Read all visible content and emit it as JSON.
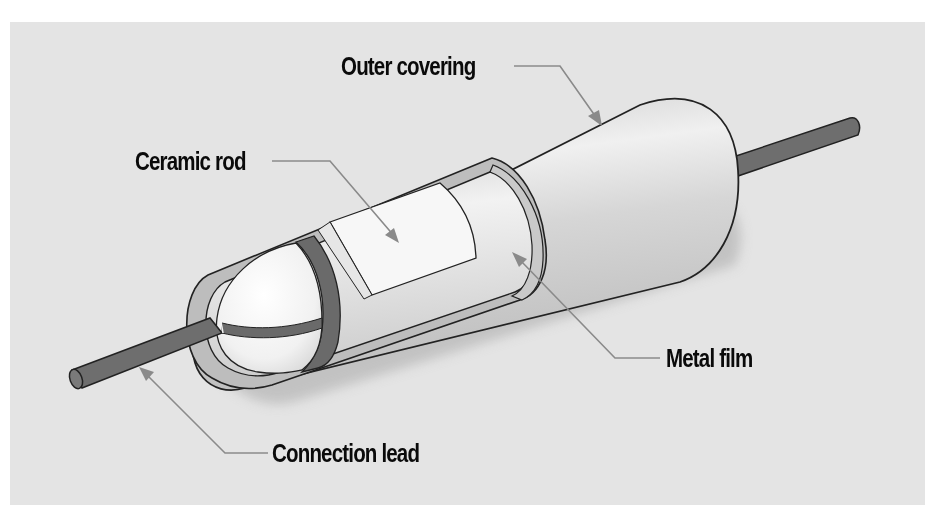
{
  "diagram": {
    "labels": {
      "outer_covering": "Outer covering",
      "ceramic_rod": "Ceramic rod",
      "metal_film": "Metal film",
      "connection_lead": "Connection lead"
    },
    "colors": {
      "background_panel": "#e4e4e4",
      "page": "#ffffff",
      "casing": "#cfcfcf",
      "casing_highlight": "#eeeeee",
      "lead": "#6e6e6e",
      "end_cap_band": "#6a6a6a",
      "ceramic": "#f6f6f6",
      "shadow": "#bdbdbd",
      "leader_line": "#8a8a8a",
      "text": "#0a0a0a"
    }
  }
}
